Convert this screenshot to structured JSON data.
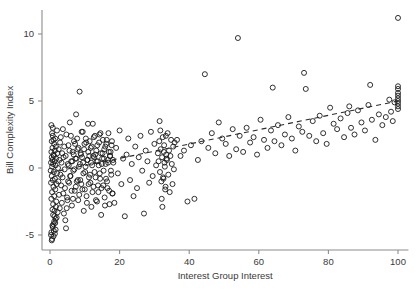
{
  "chart_data": {
    "type": "scatter",
    "title": "",
    "xlabel": "Interest Group Interest",
    "ylabel": "Bill Complexity Index",
    "xlim": [
      -2,
      103
    ],
    "ylim": [
      -6.4,
      11.8
    ],
    "xticks": [
      0,
      20,
      40,
      60,
      80,
      100
    ],
    "xtick_labels": [
      "0",
      "20",
      "40",
      "60",
      "80",
      "100"
    ],
    "yticks": [
      -5,
      0,
      5,
      10
    ],
    "ytick_labels": [
      "-5",
      "0",
      "5",
      "10"
    ],
    "grid": false,
    "legend": null,
    "marker": "open-circle",
    "marker_color": "#1a1a1a",
    "series": [
      {
        "name": "Bills",
        "x": [
          0.2,
          0.3,
          0.3,
          0.4,
          0.4,
          0.5,
          0.5,
          0.5,
          0.6,
          0.6,
          0.7,
          0.7,
          0.7,
          0.8,
          0.8,
          0.9,
          0.9,
          1.0,
          1.0,
          1.0,
          1.1,
          1.1,
          1.2,
          1.2,
          1.3,
          1.3,
          1.4,
          1.4,
          1.5,
          1.5,
          1.6,
          1.6,
          1.7,
          1.8,
          1.8,
          1.9,
          2.0,
          2.0,
          2.1,
          2.2,
          0.3,
          0.4,
          0.6,
          0.8,
          1.0,
          1.2,
          1.4,
          1.6,
          0.5,
          0.7,
          0.9,
          1.1,
          1.3,
          1.5,
          1.7,
          1.9,
          0.4,
          0.6,
          0.8,
          1.0,
          2.3,
          2.4,
          2.5,
          2.6,
          2.7,
          2.8,
          2.9,
          3.0,
          3.1,
          3.2,
          3.3,
          3.4,
          3.5,
          3.6,
          3.7,
          3.8,
          3.9,
          4.0,
          4.1,
          4.2,
          4.3,
          4.5,
          4.7,
          4.9,
          5.1,
          5.3,
          5.5,
          5.7,
          5.9,
          6.1,
          6.3,
          6.5,
          6.7,
          6.9,
          7.1,
          7.3,
          7.5,
          7.7,
          7.9,
          8.1,
          8.3,
          8.5,
          8.7,
          8.9,
          9.1,
          9.3,
          9.5,
          9.7,
          9.9,
          10.1,
          10.3,
          10.5,
          10.7,
          10.9,
          11.1,
          11.3,
          11.5,
          11.7,
          11.9,
          12.1,
          12.3,
          12.5,
          12.7,
          12.9,
          13.1,
          13.3,
          13.5,
          13.7,
          13.9,
          14.1,
          14.3,
          14.5,
          14.7,
          14.9,
          15.1,
          15.3,
          15.5,
          15.7,
          15.9,
          16.1,
          16.3,
          16.5,
          16.7,
          16.9,
          17.1,
          17.3,
          17.5,
          17.7,
          17.9,
          18.1,
          4.4,
          4.6,
          4.8,
          5.0,
          5.2,
          5.4,
          5.6,
          5.8,
          6.0,
          6.2,
          6.4,
          6.6,
          6.8,
          7.0,
          7.2,
          7.4,
          7.6,
          7.8,
          8.0,
          8.2,
          8.4,
          8.6,
          8.8,
          9.0,
          9.2,
          9.4,
          9.6,
          9.8,
          10.0,
          10.2,
          10.4,
          10.6,
          10.8,
          11.0,
          11.2,
          11.4,
          11.6,
          11.8,
          12.0,
          12.2,
          12.4,
          12.6,
          12.8,
          13.0,
          13.2,
          13.4,
          13.6,
          13.8,
          14.0,
          14.2,
          14.4,
          14.6,
          14.8,
          15.0,
          15.2,
          15.4,
          15.6,
          15.8,
          16.0,
          16.2,
          16.4,
          16.6,
          16.8,
          17.0,
          17.2,
          17.4,
          17.6,
          17.8,
          18.0,
          18.2,
          18.5,
          19.0,
          19.5,
          20.0,
          20.5,
          21.0,
          21.5,
          22.0,
          22.5,
          23.0,
          23.5,
          24.0,
          24.5,
          25.0,
          25.5,
          26.0,
          26.5,
          27.0,
          27.5,
          28.0,
          28.5,
          29.0,
          29.5,
          30.0,
          30.5,
          31.0,
          31.2,
          31.4,
          31.6,
          31.8,
          32.0,
          32.2,
          32.4,
          32.6,
          32.8,
          33.0,
          33.2,
          33.4,
          33.6,
          33.8,
          34.0,
          34.2,
          34.4,
          34.6,
          34.8,
          35.0,
          35.2,
          35.4,
          35.6,
          35.8,
          31.5,
          31.7,
          32.1,
          32.3,
          32.5,
          32.7,
          32.9,
          33.1,
          33.3,
          33.5,
          36.5,
          37.5,
          38.5,
          39.5,
          40.5,
          41.5,
          42.5,
          43.5,
          44.5,
          45.5,
          46.5,
          47.5,
          48.5,
          49.5,
          50.5,
          51.5,
          52.5,
          53.5,
          54.5,
          55.5,
          56.5,
          57.5,
          58.5,
          59.5,
          60.5,
          61.5,
          62.5,
          63.5,
          64.5,
          65.5,
          66.5,
          67.5,
          68.5,
          69.5,
          70.5,
          71.5,
          72.5,
          73.5,
          74.5,
          75.5,
          76.5,
          77.5,
          78.5,
          79.5,
          80.5,
          81.5,
          82.5,
          83.5,
          84.5,
          85.5,
          86.5,
          87.5,
          88.5,
          89.5,
          90.5,
          91.5,
          92.5,
          93.5,
          94.5,
          95.5,
          100,
          100,
          100,
          100,
          100,
          100,
          100,
          100,
          100,
          96.5,
          97.5,
          98.0,
          98.5,
          99.0,
          54.0,
          64.0,
          73.0,
          86.0,
          92.0,
          100
        ],
        "y": [
          -0.2,
          0.4,
          -1.1,
          1.2,
          -2.3,
          0.8,
          -0.6,
          2.0,
          -1.8,
          0.1,
          1.5,
          -3.1,
          0.6,
          -0.9,
          2.4,
          -2.7,
          0.3,
          1.0,
          -1.4,
          -4.2,
          0.9,
          -0.3,
          1.8,
          -2.1,
          0.5,
          -3.6,
          1.3,
          -0.8,
          2.2,
          -1.6,
          0.2,
          -4.6,
          1.6,
          -2.5,
          0.7,
          -1.2,
          2.8,
          -0.4,
          1.1,
          -3.3,
          -5.0,
          -4.8,
          -5.3,
          -4.4,
          -5.1,
          -4.0,
          -4.9,
          -3.8,
          -5.4,
          -4.3,
          -3.5,
          -4.7,
          -3.2,
          -4.1,
          -2.9,
          -3.7,
          3.2,
          2.6,
          3.0,
          2.1,
          0.0,
          -1.0,
          1.4,
          -2.0,
          0.6,
          -3.0,
          1.9,
          -0.5,
          2.3,
          -1.3,
          0.4,
          -2.6,
          1.1,
          -0.7,
          2.9,
          -1.9,
          0.8,
          -3.4,
          1.6,
          -0.1,
          -1.5,
          0.9,
          2.5,
          -2.2,
          0.3,
          1.7,
          -1.1,
          3.4,
          -0.6,
          0.5,
          -2.8,
          1.2,
          -0.2,
          2.0,
          -1.7,
          0.7,
          4.0,
          -1.0,
          1.4,
          -2.4,
          0.1,
          5.7,
          -0.9,
          1.0,
          2.7,
          -1.6,
          0.4,
          -3.2,
          1.8,
          -0.3,
          2.2,
          -2.1,
          0.6,
          3.3,
          -1.2,
          0.9,
          -0.5,
          1.5,
          -2.9,
          0.2,
          3.3,
          -1.4,
          0.8,
          2.4,
          -0.7,
          1.3,
          -2.5,
          0.5,
          -1.8,
          1.9,
          -0.4,
          2.6,
          -3.5,
          0.3,
          1.1,
          -1.3,
          0.7,
          -2.2,
          1.6,
          -0.8,
          2.1,
          -1.5,
          0.4,
          1.2,
          -2.7,
          0.9,
          -0.2,
          1.7,
          -1.9,
          0.6,
          -3.9,
          -4.5,
          -3.0,
          -2.4,
          -1.0,
          0.2,
          1.3,
          -0.6,
          2.4,
          -1.7,
          0.5,
          -2.3,
          1.0,
          -0.1,
          1.8,
          -1.4,
          0.7,
          2.2,
          -0.9,
          1.5,
          -2.0,
          0.3,
          1.1,
          -1.2,
          0.8,
          2.7,
          -0.4,
          1.4,
          -1.6,
          0.1,
          1.9,
          -2.6,
          0.6,
          1.2,
          -0.7,
          2.0,
          -1.1,
          0.4,
          1.6,
          -1.8,
          0.9,
          2.3,
          -0.3,
          1.0,
          -2.4,
          0.5,
          1.7,
          -1.3,
          0.2,
          2.5,
          -0.8,
          1.1,
          -1.5,
          0.7,
          2.1,
          -0.2,
          1.4,
          -2.8,
          0.3,
          1.8,
          -1.0,
          0.6,
          2.6,
          -1.7,
          0.9,
          1.2,
          -0.5,
          2.0,
          -1.9,
          0.4,
          -2.6,
          1.5,
          -0.4,
          2.8,
          -1.2,
          0.7,
          -3.6,
          1.0,
          2.2,
          -0.9,
          0.3,
          -2.1,
          1.6,
          -1.5,
          0.8,
          2.4,
          -0.2,
          -3.4,
          1.3,
          0.5,
          -1.1,
          2.7,
          -0.6,
          1.8,
          0.2,
          1.1,
          0.5,
          2.0,
          -0.3,
          1.4,
          -1.0,
          0.8,
          2.3,
          -0.8,
          1.7,
          0.1,
          -1.4,
          1.0,
          0.6,
          2.6,
          -0.5,
          1.3,
          -1.8,
          0.9,
          2.1,
          0.3,
          -1.2,
          1.6,
          -0.1,
          1.9,
          3.5,
          2.8,
          -2.3,
          -2.9,
          -0.7,
          1.2,
          0.4,
          -1.6,
          2.4,
          0.7,
          2.1,
          0.9,
          1.3,
          -2.5,
          1.7,
          -2.3,
          0.6,
          2.0,
          7.0,
          1.5,
          2.6,
          1.1,
          3.4,
          2.2,
          1.8,
          0.9,
          2.9,
          1.4,
          2.4,
          1.2,
          3.0,
          1.9,
          2.3,
          1.0,
          3.6,
          2.1,
          1.5,
          2.8,
          2.0,
          3.2,
          1.7,
          2.5,
          3.8,
          2.2,
          1.3,
          3.1,
          2.7,
          5.9,
          2.4,
          3.5,
          2.0,
          3.9,
          2.6,
          1.8,
          4.5,
          3.3,
          2.9,
          3.7,
          2.3,
          4.1,
          3.0,
          2.5,
          4.3,
          3.4,
          2.8,
          4.7,
          3.6,
          2.1,
          4.0,
          3.2,
          6.1,
          5.9,
          5.6,
          5.4,
          5.2,
          5.0,
          4.8,
          4.6,
          4.4,
          3.8,
          5.1,
          4.2,
          3.5,
          4.9,
          9.7,
          6.0,
          7.1,
          4.6,
          6.2,
          11.2
        ]
      }
    ],
    "fit_line": {
      "type": "dashed-linear-fit",
      "x_start": 0,
      "y_start": -0.35,
      "x_end": 100,
      "y_end": 5.0
    }
  }
}
